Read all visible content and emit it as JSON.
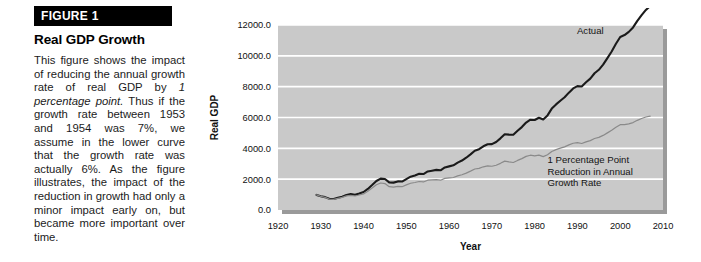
{
  "figure": {
    "banner_label": "FIGURE 1",
    "title": "Real GDP Growth",
    "caption_part1": "This figure shows the impact of reducing the annual growth rate of real GDP by ",
    "caption_emphasis": "1 percentage point.",
    "caption_part2": " Thus if the growth rate between 1953 and 1954 was 7%, we assume in the lower curve that the growth rate was actually 6%. As the figure illustrates, the impact of the reduction in growth had only a minor impact early on, but became more important over time."
  },
  "colors": {
    "banner_bg": "#000000",
    "banner_text": "#ffffff",
    "plot_bg": "#c9c9c9",
    "plot_shadow": "#9a9a9a",
    "gridline": "#ffffff",
    "actual_line": "#1a1a1a",
    "reduced_line": "#8a8a8a",
    "page_bg": "#ffffff"
  },
  "chart_data": {
    "type": "line",
    "title": "Real GDP Growth",
    "xlabel": "Year",
    "ylabel": "Real GDP",
    "xlim": [
      1920,
      2010
    ],
    "ylim": [
      0,
      12000
    ],
    "xticks": [
      "1920",
      "1930",
      "1940",
      "1950",
      "1960",
      "1970",
      "1980",
      "1990",
      "2000",
      "2010"
    ],
    "yticks": [
      "0.0",
      "2000.0",
      "4000.0",
      "6000.0",
      "8000.0",
      "10000.0",
      "12000.0"
    ],
    "grid": "horizontal",
    "legend": "none",
    "annotations": [
      {
        "name": "actual-label",
        "text": "Actual",
        "x": 1993,
        "y": 11400
      },
      {
        "name": "reduced-label-line1",
        "text": "1 Percentage Point",
        "x": 1983,
        "y": 3050
      },
      {
        "name": "reduced-label-line2",
        "text": "Reduction in Annual",
        "x": 1983,
        "y": 2300
      },
      {
        "name": "reduced-label-line3",
        "text": "Growth Rate",
        "x": 1983,
        "y": 1550
      }
    ],
    "series": [
      {
        "name": "Actual",
        "color": "#1a1a1a",
        "x": [
          1929,
          1930,
          1931,
          1932,
          1933,
          1934,
          1935,
          1936,
          1937,
          1938,
          1939,
          1940,
          1941,
          1942,
          1943,
          1944,
          1945,
          1946,
          1947,
          1948,
          1949,
          1950,
          1951,
          1952,
          1953,
          1954,
          1955,
          1956,
          1957,
          1958,
          1959,
          1960,
          1961,
          1962,
          1963,
          1964,
          1965,
          1966,
          1967,
          1968,
          1969,
          1970,
          1971,
          1972,
          1973,
          1974,
          1975,
          1976,
          1977,
          1978,
          1979,
          1980,
          1981,
          1982,
          1983,
          1984,
          1985,
          1986,
          1987,
          1988,
          1989,
          1990,
          1991,
          1992,
          1993,
          1994,
          1995,
          1996,
          1997,
          1998,
          1999,
          2000,
          2001,
          2002,
          2003,
          2004,
          2005,
          2006,
          2007
        ],
        "y": [
          977,
          894,
          836,
          728,
          718,
          796,
          866,
          979,
          1028,
          993,
          1073,
          1166,
          1366,
          1618,
          1883,
          2035,
          2012,
          1792,
          1776,
          1854,
          1844,
          2006,
          2161,
          2244,
          2347,
          2332,
          2500,
          2549,
          2601,
          2578,
          2762,
          2830,
          2897,
          3075,
          3206,
          3392,
          3610,
          3845,
          3942,
          4133,
          4262,
          4270,
          4414,
          4647,
          4917,
          4890,
          4880,
          5141,
          5378,
          5675,
          5855,
          5839,
          5987,
          5871,
          6136,
          6577,
          6849,
          7087,
          7313,
          7613,
          7886,
          8034,
          8015,
          8287,
          8523,
          8871,
          9094,
          9434,
          9854,
          10283,
          10780,
          11226,
          11347,
          11553,
          11841,
          12264,
          12638,
          12976,
          13229
        ]
      },
      {
        "name": "1 Percentage Point Reduction in Annual Growth Rate",
        "color": "#8a8a8a",
        "x": [
          1929,
          1930,
          1931,
          1932,
          1933,
          1934,
          1935,
          1936,
          1937,
          1938,
          1939,
          1940,
          1941,
          1942,
          1943,
          1944,
          1945,
          1946,
          1947,
          1948,
          1949,
          1950,
          1951,
          1952,
          1953,
          1954,
          1955,
          1956,
          1957,
          1958,
          1959,
          1960,
          1961,
          1962,
          1963,
          1964,
          1965,
          1966,
          1967,
          1968,
          1969,
          1970,
          1971,
          1972,
          1973,
          1974,
          1975,
          1976,
          1977,
          1978,
          1979,
          1980,
          1981,
          1982,
          1983,
          1984,
          1985,
          1986,
          1987,
          1988,
          1989,
          1990,
          1991,
          1992,
          1993,
          1994,
          1995,
          1996,
          1997,
          1998,
          1999,
          2000,
          2001,
          2002,
          2003,
          2004,
          2005,
          2006,
          2007
        ],
        "y": [
          977,
          885,
          819,
          706,
          690,
          757,
          816,
          914,
          950,
          908,
          971,
          1045,
          1212,
          1421,
          1638,
          1753,
          1716,
          1513,
          1485,
          1535,
          1512,
          1628,
          1737,
          1786,
          1850,
          1820,
          1932,
          1951,
          1971,
          1934,
          2051,
          2080,
          2108,
          2215,
          2286,
          2394,
          2522,
          2660,
          2699,
          2802,
          2860,
          2837,
          2904,
          3027,
          3169,
          3120,
          3083,
          3216,
          3331,
          3480,
          3554,
          3509,
          3563,
          3459,
          3579,
          3798,
          3915,
          4010,
          4097,
          4223,
          4332,
          4369,
          4315,
          4418,
          4499,
          4638,
          4709,
          4838,
          5004,
          5170,
          5366,
          5535,
          5540,
          5586,
          5670,
          5816,
          5934,
          6033,
          6090
        ]
      }
    ]
  }
}
